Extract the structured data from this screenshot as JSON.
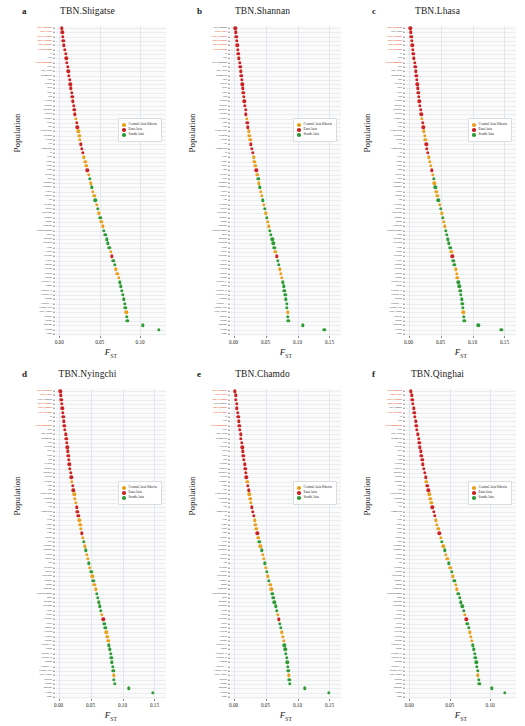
{
  "figure": {
    "yaxis_title": "Population",
    "xaxis_title": "F",
    "xaxis_title_sub": "ST"
  },
  "legend": {
    "position": "upper-middle-right",
    "items": [
      {
        "label": "Central Asia Siberia",
        "color": "#E9A11C"
      },
      {
        "label": "East Asia",
        "color": "#CC2222"
      },
      {
        "label": "South Asia",
        "color": "#2E9B35"
      }
    ]
  },
  "colors": {
    "central_asia_siberia": "#E9A11C",
    "east_asia": "#CC2222",
    "south_asia": "#2E9B35",
    "highlight_label": "#E8653A",
    "plot_background": "#FBFBFC",
    "gridline": "#EBEEF1"
  },
  "populations": [
    "TBN.Shannan",
    "TBN.Lhasa",
    "TBN.Nyingchi",
    "TBN.Chamdo",
    "TBN.Qinghai",
    "SHP.Zhongni",
    "Tu",
    "Yizu",
    "SHP.Khumjung",
    "Naxi",
    "Han_North",
    "Mongolian",
    "Xibo",
    "Korean",
    "Tujia",
    "Daur",
    "Han",
    "Hezhen",
    "Miaozu",
    "Japanese",
    "Oroqen",
    "Kalmyk",
    "Kinh",
    "She",
    "Kyrgyzstani",
    "Tuvinian",
    "Altaian",
    "Dai",
    "Cambodian",
    "Tu_2",
    "Uchi",
    "Yugur",
    "Yakut",
    "Lahu",
    "Hazara",
    "Irula",
    "Yukaghir",
    "Kashmiri",
    "Uzbek",
    "Tubalar",
    "Anu",
    "Selkups",
    "Kharia",
    "Tajikistani",
    "Bengali",
    "Mansi",
    "Chukchis",
    "Vishwabrahmin",
    "Mala",
    "Burusho",
    "Spitiasan",
    "Lodhi",
    "Altayul",
    "Koryaks",
    "Tiwari",
    "Punjabi",
    "Aleutian",
    "Tichean",
    "Itakano",
    "Gujarati_C",
    "Sindhi",
    "Gujarati_D",
    "Gujarati_B",
    "Pathans",
    "Gujarati_A",
    "Cochin_Jews",
    "Tajik_Pamiri",
    "Balochi",
    "Brahui",
    "Makrani",
    "Kalash",
    "Onge"
  ],
  "chart_data": [
    {
      "type": "scatter",
      "panel_letter": "a",
      "title": "TBN.Shigatse",
      "xlabel": "F_ST",
      "ylabel": "Population",
      "xlim": [
        -0.004,
        0.132
      ],
      "xticks": [
        0.0,
        0.05,
        0.1
      ],
      "xticklabels": [
        "0.00",
        "0.05",
        "0.10"
      ],
      "grid": true,
      "legend_visible": true,
      "highlighted_labels": [
        "TBN.Shannan",
        "TBN.Lhasa",
        "TBN.Nyingchi",
        "TBN.Chamdo",
        "TBN.Qinghai",
        "SHP.Zhongni",
        "SHP.Khumjung"
      ],
      "values": [
        0.0035,
        0.004,
        0.0046,
        0.0052,
        0.006,
        0.0068,
        0.0078,
        0.0086,
        0.0096,
        0.0105,
        0.0114,
        0.0122,
        0.013,
        0.0138,
        0.0146,
        0.0154,
        0.0162,
        0.017,
        0.0178,
        0.0187,
        0.0196,
        0.0206,
        0.0215,
        0.0225,
        0.0236,
        0.0246,
        0.0258,
        0.027,
        0.0282,
        0.0294,
        0.0307,
        0.032,
        0.0334,
        0.0348,
        0.0362,
        0.0376,
        0.039,
        0.0404,
        0.0418,
        0.0432,
        0.0446,
        0.0461,
        0.0476,
        0.0491,
        0.0506,
        0.0521,
        0.0537,
        0.0553,
        0.0569,
        0.0585,
        0.0601,
        0.0618,
        0.0635,
        0.0652,
        0.0669,
        0.0686,
        0.0703,
        0.0719,
        0.0735,
        0.075,
        0.0764,
        0.0777,
        0.0789,
        0.08,
        0.081,
        0.0819,
        0.0827,
        0.0834,
        0.0841,
        0.103,
        0.123
      ],
      "groups": [
        "east",
        "east",
        "east",
        "east",
        "east",
        "east",
        "east",
        "east",
        "east",
        "east",
        "east",
        "east",
        "east",
        "east",
        "east",
        "east",
        "east",
        "east",
        "east",
        "east",
        "east",
        "central",
        "east",
        "east",
        "central",
        "central",
        "central",
        "east",
        "east",
        "east",
        "central",
        "central",
        "central",
        "east",
        "central",
        "south",
        "central",
        "south",
        "central",
        "central",
        "south",
        "central",
        "south",
        "central",
        "south",
        "central",
        "central",
        "south",
        "south",
        "south",
        "south",
        "south",
        "central",
        "east",
        "south",
        "south",
        "central",
        "central",
        "central",
        "south",
        "south",
        "south",
        "south",
        "south",
        "south",
        "south",
        "central",
        "south",
        "south",
        "south",
        "south"
      ]
    },
    {
      "type": "scatter",
      "panel_letter": "b",
      "title": "TBN.Shannan",
      "xlabel": "F_ST",
      "ylabel": "Population",
      "xlim": [
        -0.004,
        0.168
      ],
      "xticks": [
        0.0,
        0.05,
        0.1,
        0.15
      ],
      "xticklabels": [
        "0.00",
        "0.05",
        "0.10",
        "0.15"
      ],
      "grid": true,
      "legend_visible": true,
      "highlighted_labels": [
        "TBN.Shigatse",
        "TBN.Lhasa",
        "TBN.Nyingchi",
        "TBN.Chamdo",
        "TBN.Qinghai",
        "SHP.Zhongni"
      ],
      "values": [
        0.003,
        0.0036,
        0.0042,
        0.005,
        0.0058,
        0.0066,
        0.0076,
        0.0085,
        0.0095,
        0.0104,
        0.0113,
        0.0121,
        0.0129,
        0.0137,
        0.0145,
        0.0153,
        0.0161,
        0.0169,
        0.0178,
        0.0187,
        0.0196,
        0.0206,
        0.0216,
        0.0227,
        0.0238,
        0.0249,
        0.0261,
        0.0273,
        0.0286,
        0.0299,
        0.0312,
        0.0326,
        0.034,
        0.0354,
        0.0369,
        0.0384,
        0.0399,
        0.0414,
        0.0429,
        0.0444,
        0.0459,
        0.0474,
        0.049,
        0.0506,
        0.0522,
        0.0538,
        0.0554,
        0.057,
        0.0587,
        0.0604,
        0.0621,
        0.0638,
        0.0655,
        0.0672,
        0.0689,
        0.0706,
        0.0722,
        0.0738,
        0.0753,
        0.0768,
        0.0782,
        0.0795,
        0.0807,
        0.0818,
        0.0828,
        0.0837,
        0.0845,
        0.0852,
        0.0859,
        0.108,
        0.142
      ],
      "groups": [
        "east",
        "east",
        "east",
        "east",
        "east",
        "east",
        "east",
        "east",
        "east",
        "east",
        "east",
        "east",
        "east",
        "east",
        "east",
        "east",
        "east",
        "east",
        "east",
        "east",
        "east",
        "central",
        "east",
        "east",
        "central",
        "central",
        "central",
        "east",
        "east",
        "east",
        "central",
        "central",
        "central",
        "east",
        "central",
        "south",
        "central",
        "south",
        "central",
        "central",
        "south",
        "central",
        "south",
        "central",
        "south",
        "central",
        "central",
        "south",
        "south",
        "south",
        "south",
        "south",
        "central",
        "east",
        "south",
        "south",
        "central",
        "central",
        "central",
        "south",
        "south",
        "south",
        "south",
        "south",
        "south",
        "south",
        "central",
        "south",
        "south",
        "south",
        "south"
      ]
    },
    {
      "type": "scatter",
      "panel_letter": "c",
      "title": "TBN.Lhasa",
      "xlabel": "F_ST",
      "ylabel": "Population",
      "xlim": [
        -0.004,
        0.168
      ],
      "xticks": [
        0.0,
        0.05,
        0.1,
        0.15
      ],
      "xticklabels": [
        "0.00",
        "0.05",
        "0.10",
        "0.15"
      ],
      "grid": true,
      "legend_visible": true,
      "highlighted_labels": [
        "TBN.Shannan",
        "TBN.Shigatse",
        "TBN.Nyingchi",
        "TBN.Chamdo",
        "TBN.Qinghai",
        "SHP.Zhongni",
        "SHP.Khumjung"
      ],
      "values": [
        0.0028,
        0.0034,
        0.0041,
        0.0049,
        0.0057,
        0.0065,
        0.0075,
        0.0084,
        0.0094,
        0.0103,
        0.0112,
        0.012,
        0.0128,
        0.0136,
        0.0144,
        0.0152,
        0.0161,
        0.017,
        0.0179,
        0.0188,
        0.0198,
        0.0208,
        0.0218,
        0.0229,
        0.024,
        0.0252,
        0.0264,
        0.0277,
        0.029,
        0.0303,
        0.0317,
        0.0331,
        0.0345,
        0.036,
        0.0375,
        0.039,
        0.0405,
        0.042,
        0.0436,
        0.0452,
        0.0468,
        0.0484,
        0.05,
        0.0516,
        0.0532,
        0.0548,
        0.0565,
        0.0582,
        0.0599,
        0.0616,
        0.0633,
        0.065,
        0.0667,
        0.0684,
        0.0701,
        0.0718,
        0.0734,
        0.075,
        0.0765,
        0.078,
        0.0794,
        0.0807,
        0.0819,
        0.083,
        0.084,
        0.0849,
        0.0857,
        0.0864,
        0.0871,
        0.109,
        0.145
      ],
      "groups": [
        "east",
        "east",
        "east",
        "east",
        "east",
        "east",
        "east",
        "east",
        "east",
        "east",
        "east",
        "east",
        "east",
        "east",
        "east",
        "east",
        "east",
        "east",
        "east",
        "east",
        "east",
        "central",
        "east",
        "east",
        "central",
        "central",
        "central",
        "east",
        "east",
        "east",
        "central",
        "central",
        "central",
        "east",
        "central",
        "south",
        "central",
        "south",
        "central",
        "central",
        "south",
        "central",
        "south",
        "central",
        "south",
        "central",
        "central",
        "south",
        "south",
        "south",
        "south",
        "south",
        "central",
        "east",
        "south",
        "south",
        "central",
        "central",
        "central",
        "south",
        "south",
        "south",
        "south",
        "south",
        "south",
        "south",
        "central",
        "south",
        "south",
        "south",
        "south"
      ]
    },
    {
      "type": "scatter",
      "panel_letter": "d",
      "title": "TBN.Nyingchi",
      "xlabel": "F_ST",
      "ylabel": "Population",
      "xlim": [
        -0.004,
        0.168
      ],
      "xticks": [
        0.0,
        0.05,
        0.1,
        0.15
      ],
      "xticklabels": [
        "0.00",
        "0.05",
        "0.10",
        "0.15"
      ],
      "grid": true,
      "legend_visible": true,
      "highlighted_labels": [
        "TBN.Chamdo",
        "TBN.Qinghai",
        "TBN.Lhasa",
        "TBN.Shannan",
        "TBN.Shigatse",
        "SHP.Zhongni",
        "SHP.Khumjung"
      ],
      "values": [
        0.0026,
        0.0033,
        0.004,
        0.0048,
        0.0056,
        0.0064,
        0.0073,
        0.0082,
        0.0092,
        0.0101,
        0.011,
        0.0119,
        0.0127,
        0.0135,
        0.0143,
        0.0152,
        0.0161,
        0.017,
        0.018,
        0.019,
        0.02,
        0.021,
        0.0221,
        0.0232,
        0.0244,
        0.0256,
        0.0269,
        0.0282,
        0.0295,
        0.0309,
        0.0323,
        0.0337,
        0.0352,
        0.0367,
        0.0382,
        0.0397,
        0.0413,
        0.0429,
        0.0445,
        0.0461,
        0.0477,
        0.0493,
        0.051,
        0.0527,
        0.0544,
        0.0561,
        0.0578,
        0.0595,
        0.0612,
        0.0629,
        0.0646,
        0.0663,
        0.068,
        0.0697,
        0.0714,
        0.073,
        0.0746,
        0.0761,
        0.0776,
        0.079,
        0.0803,
        0.0815,
        0.0826,
        0.0836,
        0.0845,
        0.0853,
        0.0861,
        0.0868,
        0.0875,
        0.11,
        0.147
      ],
      "groups": [
        "east",
        "east",
        "east",
        "east",
        "east",
        "east",
        "east",
        "east",
        "east",
        "east",
        "east",
        "east",
        "east",
        "east",
        "east",
        "east",
        "east",
        "east",
        "east",
        "east",
        "east",
        "central",
        "east",
        "east",
        "central",
        "central",
        "central",
        "east",
        "east",
        "east",
        "central",
        "central",
        "central",
        "east",
        "central",
        "south",
        "central",
        "south",
        "central",
        "central",
        "south",
        "central",
        "south",
        "central",
        "south",
        "central",
        "central",
        "south",
        "south",
        "south",
        "south",
        "south",
        "central",
        "east",
        "south",
        "south",
        "central",
        "central",
        "central",
        "south",
        "south",
        "south",
        "south",
        "south",
        "south",
        "south",
        "central",
        "south",
        "south",
        "south",
        "south"
      ]
    },
    {
      "type": "scatter",
      "panel_letter": "e",
      "title": "TBN.Chamdo",
      "xlabel": "F_ST",
      "ylabel": "Population",
      "xlim": [
        -0.004,
        0.168
      ],
      "xticks": [
        0.0,
        0.05,
        0.1,
        0.15
      ],
      "xticklabels": [
        "0.00",
        "0.05",
        "0.10",
        "0.15"
      ],
      "grid": true,
      "legend_visible": true,
      "highlighted_labels": [
        "TBN.Nyingchi",
        "TBN.Qinghai",
        "TBN.Lhasa",
        "TBN.Shannan",
        "TBN.Shigatse",
        "SHP.Zhongni",
        "SHP.Khumjung"
      ],
      "values": [
        0.0024,
        0.0031,
        0.0039,
        0.0047,
        0.0055,
        0.0063,
        0.0072,
        0.0081,
        0.0091,
        0.01,
        0.0109,
        0.0118,
        0.0126,
        0.0135,
        0.0144,
        0.0153,
        0.0162,
        0.0172,
        0.0182,
        0.0192,
        0.0202,
        0.0213,
        0.0224,
        0.0236,
        0.0248,
        0.026,
        0.0273,
        0.0286,
        0.03,
        0.0314,
        0.0328,
        0.0343,
        0.0358,
        0.0373,
        0.0389,
        0.0405,
        0.0421,
        0.0437,
        0.0453,
        0.047,
        0.0487,
        0.0504,
        0.0521,
        0.0538,
        0.0555,
        0.0572,
        0.0589,
        0.0606,
        0.0623,
        0.064,
        0.0657,
        0.0674,
        0.0691,
        0.0707,
        0.0723,
        0.0739,
        0.0754,
        0.0769,
        0.0783,
        0.0796,
        0.0808,
        0.082,
        0.083,
        0.084,
        0.0849,
        0.0857,
        0.0865,
        0.0872,
        0.0879,
        0.111,
        0.149
      ],
      "groups": [
        "east",
        "east",
        "east",
        "east",
        "east",
        "east",
        "east",
        "east",
        "east",
        "east",
        "east",
        "east",
        "east",
        "east",
        "east",
        "east",
        "east",
        "east",
        "east",
        "east",
        "east",
        "central",
        "east",
        "east",
        "central",
        "central",
        "central",
        "east",
        "east",
        "east",
        "central",
        "central",
        "central",
        "east",
        "central",
        "south",
        "central",
        "south",
        "central",
        "central",
        "south",
        "central",
        "south",
        "central",
        "south",
        "central",
        "central",
        "south",
        "south",
        "south",
        "south",
        "south",
        "central",
        "east",
        "south",
        "south",
        "central",
        "central",
        "central",
        "south",
        "south",
        "south",
        "south",
        "south",
        "south",
        "south",
        "central",
        "south",
        "south",
        "south",
        "south"
      ]
    },
    {
      "type": "scatter",
      "panel_letter": "f",
      "title": "TBN.Qinghai",
      "xlabel": "F_ST",
      "ylabel": "Population",
      "xlim": [
        -0.004,
        0.132
      ],
      "xticks": [
        0.0,
        0.05,
        0.1
      ],
      "xticklabels": [
        "0.00",
        "0.05",
        "0.10"
      ],
      "grid": true,
      "legend_visible": true,
      "highlighted_labels": [
        "TBN.Chamdo",
        "TBN.Nyingchi",
        "TBN.Lhasa",
        "TBN.Shannan",
        "TBN.Shigatse",
        "SHP.Zhongni",
        "SHP.Khumjung"
      ],
      "values": [
        0.0022,
        0.0029,
        0.0037,
        0.0045,
        0.0053,
        0.0061,
        0.007,
        0.0079,
        0.0088,
        0.0097,
        0.0106,
        0.0115,
        0.0124,
        0.0133,
        0.0142,
        0.0151,
        0.0161,
        0.0171,
        0.0181,
        0.0191,
        0.0202,
        0.0213,
        0.0224,
        0.0236,
        0.0248,
        0.0261,
        0.0274,
        0.0287,
        0.0301,
        0.0315,
        0.0329,
        0.0344,
        0.0359,
        0.0374,
        0.039,
        0.0406,
        0.0422,
        0.0438,
        0.0455,
        0.0472,
        0.0489,
        0.0506,
        0.0523,
        0.054,
        0.0557,
        0.0574,
        0.0591,
        0.0608,
        0.0625,
        0.0641,
        0.0657,
        0.0673,
        0.0689,
        0.0704,
        0.0719,
        0.0734,
        0.0748,
        0.0762,
        0.0775,
        0.0787,
        0.0798,
        0.0809,
        0.0819,
        0.0828,
        0.0836,
        0.0844,
        0.0851,
        0.0858,
        0.0864,
        0.102,
        0.118
      ],
      "groups": [
        "east",
        "east",
        "east",
        "east",
        "east",
        "east",
        "east",
        "east",
        "east",
        "east",
        "east",
        "east",
        "east",
        "east",
        "east",
        "east",
        "east",
        "east",
        "east",
        "east",
        "east",
        "central",
        "east",
        "east",
        "central",
        "central",
        "central",
        "east",
        "east",
        "east",
        "central",
        "central",
        "central",
        "east",
        "central",
        "south",
        "central",
        "south",
        "central",
        "central",
        "south",
        "central",
        "south",
        "central",
        "south",
        "central",
        "central",
        "south",
        "south",
        "south",
        "south",
        "south",
        "central",
        "east",
        "south",
        "south",
        "central",
        "central",
        "central",
        "south",
        "south",
        "south",
        "south",
        "south",
        "south",
        "south",
        "central",
        "south",
        "south",
        "south",
        "south"
      ]
    }
  ]
}
